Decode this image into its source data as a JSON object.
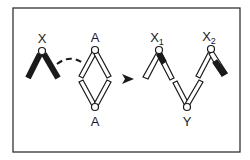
{
  "diagram": {
    "type": "chromosome-pairing-schematic",
    "colors": {
      "ink": "#1a1a1a",
      "background": "#ffffff",
      "frame": "#333333"
    },
    "labels": {
      "x": "X",
      "a_top": "A",
      "a_bottom": "A",
      "x1": "X",
      "x1_sub": "1",
      "x2": "X",
      "x2_sub": "2",
      "y": "Y"
    },
    "elements": [
      {
        "id": "x-chromosome",
        "label": "X",
        "style": "solid black, two arms"
      },
      {
        "id": "a-diamond",
        "label": "A",
        "style": "white bars forming diamond with nodes top and bottom"
      },
      {
        "id": "dashed-link",
        "from": "x-chromosome",
        "to": "a-diamond"
      },
      {
        "id": "arrow",
        "direction": "right"
      },
      {
        "id": "x1-chromosome",
        "label": "X1",
        "style": "white bars, black segment near node on right arm"
      },
      {
        "id": "y-chromosome",
        "label": "Y",
        "style": "white V-shaped bars"
      },
      {
        "id": "x2-chromosome",
        "label": "X2",
        "style": "white bars, black lower segment on right arm"
      }
    ]
  }
}
